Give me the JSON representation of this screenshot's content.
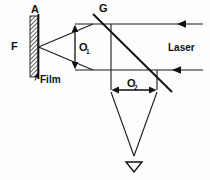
{
  "figure": {
    "type": "optical-ray-diagram",
    "background_color": "#fdfdfd",
    "line_color": "#1a1a1a"
  },
  "labels": {
    "a": "A",
    "f": "F",
    "film": "Film",
    "g": "G",
    "laser": "Laser",
    "o1_base": "O",
    "o1_sub": "1",
    "o2_base": "O",
    "o2_sub": "2"
  },
  "elements": {
    "film_plate": {
      "name": "Film",
      "top_label": "A",
      "focus_label": "F",
      "hatched": true,
      "x": 30,
      "y_top": 16,
      "y_bottom": 77,
      "width": 8
    },
    "beam_splitter": {
      "name": "G",
      "type": "diagonal-plate",
      "from": [
        93,
        14
      ],
      "to": [
        172,
        92
      ]
    },
    "laser_source": {
      "label": "Laser",
      "beams": 2,
      "direction": "right-to-left",
      "upper_beam_y": 24,
      "lower_beam_y": 70
    },
    "dimension_o1": {
      "label": "O1",
      "orientation": "vertical",
      "x": 75,
      "y_top": 26,
      "y_bottom": 68
    },
    "dimension_o2": {
      "label": "O2",
      "orientation": "horizontal",
      "y": 90,
      "x_left": 111,
      "x_right": 157
    },
    "converging_cone": {
      "apex": [
        134,
        158
      ],
      "top_left": [
        111,
        92
      ],
      "top_right": [
        157,
        92
      ],
      "arrowhead": "down-triangle"
    }
  }
}
